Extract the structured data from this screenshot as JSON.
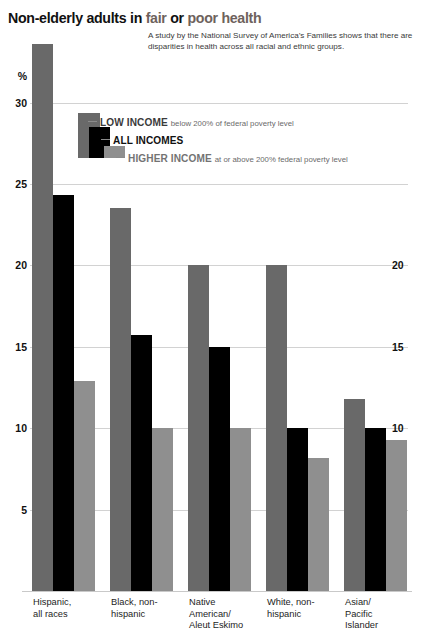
{
  "header": {
    "title_part1": "Non-elderly adults in ",
    "title_fair": "fair",
    "title_or": " or ",
    "title_poor": "poor health",
    "subtitle": "A study by the National Survey of America’s Families shows that there are disparities in health across all racial and ethnic groups."
  },
  "axis": {
    "unit_label": "%",
    "left_ticks": [
      "30",
      "25",
      "20",
      "15",
      "10",
      "5"
    ],
    "right_ticks": [
      "20",
      "15",
      "10",
      "5"
    ]
  },
  "legend": {
    "items": [
      {
        "title": "LOW INCOME",
        "desc": "below 200% of federal poverty level",
        "color": "#696969"
      },
      {
        "title": "ALL INCOMES",
        "desc": "",
        "color": "#000000"
      },
      {
        "title": "HIGHER INCOME",
        "desc": "at or above 200% federal poverty level",
        "color": "#8f8f8f"
      }
    ]
  },
  "chart_data": {
    "type": "bar",
    "title": "Non-elderly adults in fair or poor health",
    "subtitle": "A study by the National Survey of America’s Families shows that there are disparities in health across all racial and ethnic groups.",
    "xlabel": "",
    "ylabel": "%",
    "ylim": [
      0,
      34
    ],
    "yticks": [
      5,
      10,
      15,
      20,
      25,
      30
    ],
    "grid": true,
    "legend_position": "top-center",
    "categories": [
      "Hispanic, all races",
      "Black, non-hispanic",
      "Native American/ Aleut Eskimo",
      "White, non-hispanic",
      "Asian/ Pacific Islander"
    ],
    "category_lines": [
      [
        "Hispanic,",
        "all races"
      ],
      [
        "Black, non-",
        "hispanic"
      ],
      [
        "Native",
        "American/",
        "Aleut Eskimo"
      ],
      [
        "White, non-",
        "hispanic"
      ],
      [
        "Asian/",
        "Pacific",
        "Islander"
      ]
    ],
    "series": [
      {
        "name": "LOW INCOME",
        "color": "#696969",
        "values": [
          33.6,
          23.5,
          20.0,
          20.0,
          11.8
        ]
      },
      {
        "name": "ALL INCOMES",
        "color": "#000000",
        "values": [
          24.3,
          15.7,
          15.0,
          10.0,
          10.0
        ]
      },
      {
        "name": "HIGHER INCOME",
        "color": "#8f8f8f",
        "values": [
          12.9,
          10.0,
          10.0,
          8.2,
          9.3
        ]
      }
    ]
  }
}
